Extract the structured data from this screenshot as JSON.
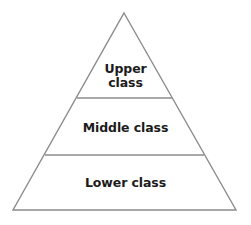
{
  "diagram": {
    "type": "pyramid",
    "colors": {
      "line": "#8c8c8c",
      "fill": "#ffffff",
      "text": "#1c1c1c"
    },
    "tiers": [
      {
        "id": "upper",
        "line1": "Upper",
        "line2": "class"
      },
      {
        "id": "middle",
        "label": "Middle class"
      },
      {
        "id": "lower",
        "label": "Lower class"
      }
    ]
  }
}
